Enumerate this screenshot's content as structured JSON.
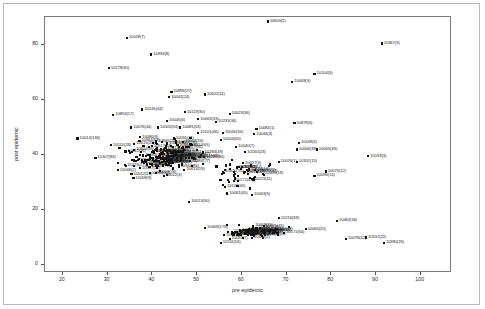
{
  "chart_data": {
    "type": "scatter",
    "title": "",
    "xlabel": "pre epidemic",
    "ylabel": "post epidemic",
    "xlim": [
      16,
      107
    ],
    "ylim": [
      -3,
      90
    ],
    "xticks": [
      20,
      30,
      40,
      50,
      60,
      70,
      80,
      90,
      100
    ],
    "yticks": [
      0,
      20,
      40,
      60,
      80
    ],
    "grid": false,
    "legend": null,
    "marker": "filled-square",
    "marker_color": "#111111",
    "point_label_format": "id(count)",
    "points": [
      {
        "label": "10603(2)",
        "x": 66.0,
        "y": 88.0
      },
      {
        "label": "10028(7)",
        "x": 34.5,
        "y": 82.0
      },
      {
        "label": "10367(3)",
        "x": 91.5,
        "y": 80.0
      },
      {
        "label": "10994(8)",
        "x": 40.0,
        "y": 76.0
      },
      {
        "label": "10178(30)",
        "x": 30.5,
        "y": 71.0
      },
      {
        "label": "10104(5)",
        "x": 76.5,
        "y": 69.0
      },
      {
        "label": "10069(3)",
        "x": 71.5,
        "y": 66.0
      },
      {
        "label": "10893(27)",
        "x": 44.5,
        "y": 62.5
      },
      {
        "label": "10622(11)",
        "x": 52.0,
        "y": 61.5
      },
      {
        "label": "10041(24)",
        "x": 44.0,
        "y": 60.5
      },
      {
        "label": "10245(44)",
        "x": 38.0,
        "y": 56.0
      },
      {
        "label": "10119(30)",
        "x": 47.5,
        "y": 55.0
      },
      {
        "label": "10023(36)",
        "x": 57.5,
        "y": 54.5
      },
      {
        "label": "10853(17)",
        "x": 31.5,
        "y": 54.0
      },
      {
        "label": "10063(33)",
        "x": 50.5,
        "y": 52.5
      },
      {
        "label": "10045(6)",
        "x": 43.5,
        "y": 52.0
      },
      {
        "label": "10233(34)",
        "x": 54.5,
        "y": 51.5
      },
      {
        "label": "10879(6)",
        "x": 72.0,
        "y": 51.0
      },
      {
        "label": "10076(44)",
        "x": 35.5,
        "y": 49.5
      },
      {
        "label": "10005(53)",
        "x": 41.5,
        "y": 49.5
      },
      {
        "label": "10481(53)",
        "x": 46.5,
        "y": 49.5
      },
      {
        "label": "10084(1)",
        "x": 63.5,
        "y": 49.0
      },
      {
        "label": "10101(46)",
        "x": 50.5,
        "y": 47.5
      },
      {
        "label": "10046(34)",
        "x": 56.0,
        "y": 47.5
      },
      {
        "label": "10044(3)",
        "x": 63.0,
        "y": 47.0
      },
      {
        "label": "10014(136)",
        "x": 23.5,
        "y": 45.5
      },
      {
        "label": "10086(9)",
        "x": 37.5,
        "y": 46.0
      },
      {
        "label": "10051(41)",
        "x": 45.0,
        "y": 45.5
      },
      {
        "label": "10104(65)",
        "x": 55.5,
        "y": 45.0
      },
      {
        "label": "10149(4)",
        "x": 73.0,
        "y": 44.0
      },
      {
        "label": "10110(28)",
        "x": 31.0,
        "y": 43.0
      },
      {
        "label": "10100(5)",
        "x": 49.0,
        "y": 43.0
      },
      {
        "label": "10040(7)",
        "x": 59.0,
        "y": 42.5
      },
      {
        "label": "10065(39)",
        "x": 77.0,
        "y": 41.5
      },
      {
        "label": "10006(39)",
        "x": 72.5,
        "y": 41.5
      },
      {
        "label": "10160(23)",
        "x": 61.0,
        "y": 40.5
      },
      {
        "label": "10159(3)",
        "x": 88.5,
        "y": 39.0
      },
      {
        "label": "10107(84)",
        "x": 27.5,
        "y": 38.5
      },
      {
        "label": "10026(1)",
        "x": 68.5,
        "y": 37.0
      },
      {
        "label": "10102(13)",
        "x": 72.5,
        "y": 37.0
      },
      {
        "label": "10027(3)",
        "x": 60.5,
        "y": 36.5
      },
      {
        "label": "10062(2)",
        "x": 59.5,
        "y": 35.0
      },
      {
        "label": "10046(2)",
        "x": 32.5,
        "y": 34.0
      },
      {
        "label": "10075(12)",
        "x": 79.0,
        "y": 33.5
      },
      {
        "label": "10095(14)",
        "x": 76.5,
        "y": 32.0
      },
      {
        "label": "10003(78)",
        "x": 41.0,
        "y": 33.0
      },
      {
        "label": "10008(9)",
        "x": 36.0,
        "y": 31.0
      },
      {
        "label": "10123(45)",
        "x": 56.5,
        "y": 28.0
      },
      {
        "label": "10061(65)",
        "x": 57.0,
        "y": 25.5
      },
      {
        "label": "10063(5)",
        "x": 62.5,
        "y": 25.0
      },
      {
        "label": "10013(50)",
        "x": 48.5,
        "y": 22.5
      },
      {
        "label": "10216(59)",
        "x": 68.5,
        "y": 16.5
      },
      {
        "label": "10463(18)",
        "x": 81.5,
        "y": 15.5
      },
      {
        "label": "10469(175)",
        "x": 52.0,
        "y": 13.0
      },
      {
        "label": "10490(109)",
        "x": 63.5,
        "y": 13.0
      },
      {
        "label": "10065(20)",
        "x": 74.5,
        "y": 12.5
      },
      {
        "label": "10083(28)",
        "x": 58.0,
        "y": 11.0
      },
      {
        "label": "10057(10)",
        "x": 65.5,
        "y": 10.5
      },
      {
        "label": "10537(22)",
        "x": 88.0,
        "y": 9.5
      },
      {
        "label": "10078(42)",
        "x": 83.5,
        "y": 9.0
      },
      {
        "label": "10390(25)",
        "x": 92.0,
        "y": 7.5
      },
      {
        "label": "10116(16)",
        "x": 55.5,
        "y": 7.5
      },
      {
        "label": "10053(7)",
        "x": 57.5,
        "y": 9.0
      }
    ],
    "cluster_note": "dense overlapping point cloud in central region and a lower horizontal band"
  }
}
